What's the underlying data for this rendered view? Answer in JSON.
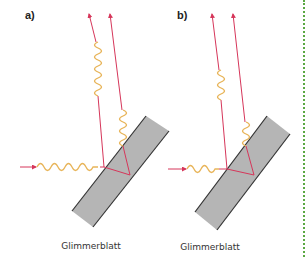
{
  "panels": [
    {
      "label": "a)",
      "caption": "Glimmerblatt",
      "description": "Thin mica sheet: reflected waves from front and back surfaces out of phase (destructive interference)"
    },
    {
      "label": "b)",
      "caption": "Glimmerblatt",
      "description": "Thin mica sheet: reflected waves from front and back surfaces in phase (constructive interference)"
    }
  ],
  "colors": {
    "ray": "#d6365a",
    "wave": "#e8b55a",
    "plate_fill": "#b5b5b5",
    "plate_edge": "#333333",
    "border": "#5aa842"
  }
}
